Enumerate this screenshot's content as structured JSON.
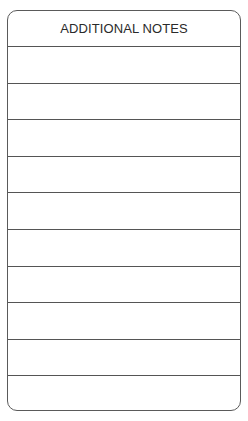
{
  "form": {
    "title": "ADDITIONAL NOTES",
    "lines": [
      "",
      "",
      "",
      "",
      "",
      "",
      "",
      "",
      "",
      ""
    ]
  }
}
